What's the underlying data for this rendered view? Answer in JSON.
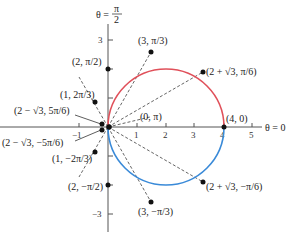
{
  "diagram": {
    "type": "polar-graph",
    "curve": "r = 4 cos(θ - ... ) circle through origin, center (2,0) radius 2",
    "colors": {
      "upper_arc": "#e0505a",
      "lower_arc": "#3a8ad8",
      "axis": "#555555",
      "rays": "#555555",
      "points": "#111111"
    },
    "axis_labels": {
      "vertical_prefix": "θ =",
      "vertical_num": "π",
      "vertical_den": "2",
      "horizontal": "θ = 0"
    },
    "x_ticks": [
      "1",
      "2",
      "3",
      "4",
      "5"
    ],
    "y_ticks": {
      "top": "3",
      "bottom": "−3",
      "left": "−1"
    },
    "points": [
      {
        "label": "(3, π/3)",
        "r": "3",
        "theta": "π/3"
      },
      {
        "label": "(2 + √3, π/6)",
        "r": "2 + √3",
        "theta": "π/6"
      },
      {
        "label": "(4, 0)",
        "r": "4",
        "theta": "0"
      },
      {
        "label": "(2 + √3, −π/6)",
        "r": "2 + √3",
        "theta": "−π/6"
      },
      {
        "label": "(3, −π/3)",
        "r": "3",
        "theta": "−π/3"
      },
      {
        "label": "(2, −π/2)",
        "r": "2",
        "theta": "−π/2"
      },
      {
        "label": "(1, −2π/3)",
        "r": "1",
        "theta": "−2π/3"
      },
      {
        "label": "(2 − √3, −5π/6)",
        "r": "2 − √3",
        "theta": "−5π/6"
      },
      {
        "label": "(0, π)",
        "r": "0",
        "theta": "π"
      },
      {
        "label": "(2 − √3, 5π/6)",
        "r": "2 − √3",
        "theta": "5π/6"
      },
      {
        "label": "(1, 2π/3)",
        "r": "1",
        "theta": "2π/3"
      },
      {
        "label": "(2, π/2)",
        "r": "2",
        "theta": "π/2"
      }
    ]
  }
}
